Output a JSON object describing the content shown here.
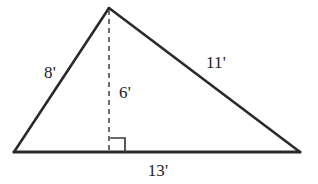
{
  "figure": {
    "kind": "geometry-diagram",
    "shape": "triangle",
    "background_color": "#ffffff",
    "stroke_color": "#2a2a2a",
    "label_color": "#232323",
    "labels": {
      "left_side": "8'",
      "right_side": "11'",
      "altitude": "6'",
      "base": "13'"
    },
    "measurements": {
      "left_side_value": 8,
      "right_side_value": 11,
      "altitude_value": 6,
      "base_value": 13,
      "unit": "feet",
      "unit_symbol": "'"
    },
    "geometry": {
      "apex": [
        109,
        8
      ],
      "bottom_left": [
        14,
        152
      ],
      "bottom_right": [
        300,
        152
      ],
      "altitude_foot": [
        109,
        152
      ],
      "right_angle_marker": {
        "x": 111,
        "y": 138,
        "size": 14
      },
      "altitude_dash_pattern": "5 4"
    }
  }
}
